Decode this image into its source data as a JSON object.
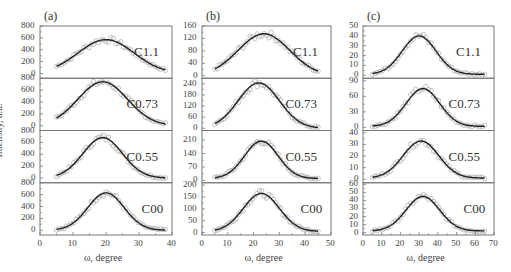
{
  "figure": {
    "ylabel": "Intensity, a.u.",
    "panels": [
      {
        "label": "(a)",
        "xlabel": "ω, degree",
        "xticks": [
          "0",
          "10",
          "20",
          "30",
          "40"
        ],
        "xlim": [
          0,
          40
        ],
        "subplots": [
          {
            "name": "C1.1",
            "yticks": [
              "0",
              "200",
              "400",
              "600",
              "800"
            ],
            "ylim": [
              -80,
              800
            ]
          },
          {
            "name": "C0.73",
            "yticks": [
              "0",
              "200",
              "400",
              "600",
              "800"
            ],
            "ylim": [
              -80,
              800
            ]
          },
          {
            "name": "C0.55",
            "yticks": [
              "0",
              "200",
              "400",
              "600",
              "800"
            ],
            "ylim": [
              -80,
              800
            ]
          },
          {
            "name": "C00",
            "yticks": [
              "0",
              "200",
              "400",
              "600",
              "800"
            ],
            "ylim": [
              -80,
              800
            ]
          }
        ]
      },
      {
        "label": "(b)",
        "xlabel": "ω, degree",
        "xticks": [
          "0",
          "10",
          "20",
          "30",
          "40",
          "50"
        ],
        "xlim": [
          0,
          50
        ],
        "subplots": [
          {
            "name": "C1.1",
            "yticks": [
              "0",
              "40",
              "80",
              "120",
              "160"
            ],
            "ylim": [
              -8,
              160
            ]
          },
          {
            "name": "C0.73",
            "yticks": [
              "0",
              "60",
              "120",
              "180",
              "240"
            ],
            "ylim": [
              -12,
              270
            ]
          },
          {
            "name": "C0.55",
            "yticks": [
              "0",
              "70",
              "140",
              "210"
            ],
            "ylim": [
              -12,
              260
            ]
          },
          {
            "name": "C00",
            "yticks": [
              "0",
              "50",
              "100",
              "150",
              "200"
            ],
            "ylim": [
              -10,
              210
            ]
          }
        ]
      },
      {
        "label": "(c)",
        "xlabel": "ω, degree",
        "xticks": [
          "0",
          "10",
          "20",
          "30",
          "40",
          "50",
          "60",
          "70"
        ],
        "xlim": [
          0,
          70
        ],
        "subplots": [
          {
            "name": "C1.1",
            "yticks": [
              "0",
              "10",
              "20",
              "30",
              "40",
              "50"
            ],
            "ylim": [
              -3,
              50
            ]
          },
          {
            "name": "C0.73",
            "yticks": [
              "0",
              "30",
              "60",
              "90"
            ],
            "ylim": [
              -6,
              95
            ]
          },
          {
            "name": "C0.55",
            "yticks": [
              "0",
              "10",
              "20",
              "30",
              "40"
            ],
            "ylim": [
              -3,
              42
            ]
          },
          {
            "name": "C00",
            "yticks": [
              "0",
              "10",
              "20",
              "30",
              "40",
              "50",
              "60"
            ],
            "ylim": [
              -3,
              62
            ]
          }
        ]
      }
    ]
  },
  "chart_data": [
    {
      "type": "scatter",
      "title": "(a)",
      "xlabel": "ω, degree",
      "ylabel": "Intensity, a.u.",
      "x_range": [
        5,
        38
      ],
      "series": [
        {
          "name": "C1.1",
          "peak_x": 20,
          "peak_y": 570,
          "width_sigma": 8.5,
          "baseline": 0,
          "start_y": 60,
          "end_y": 20
        },
        {
          "name": "C0.73",
          "peak_x": 19,
          "peak_y": 740,
          "width_sigma": 7.5,
          "baseline": 0,
          "start_y": 60,
          "end_y": 20
        },
        {
          "name": "C0.55",
          "peak_x": 19,
          "peak_y": 680,
          "width_sigma": 6.0,
          "baseline": 0,
          "start_y": 60,
          "end_y": 30
        },
        {
          "name": "C00",
          "peak_x": 20,
          "peak_y": 630,
          "width_sigma": 5.5,
          "baseline": 0,
          "start_y": 60,
          "end_y": 40
        }
      ]
    },
    {
      "type": "scatter",
      "title": "(b)",
      "xlabel": "ω, degree",
      "ylabel": "Intensity, a.u.",
      "x_range": [
        5,
        45
      ],
      "series": [
        {
          "name": "C1.1",
          "peak_x": 24,
          "peak_y": 135,
          "width_sigma": 10,
          "baseline": 0,
          "start_y": 15,
          "end_y": 5
        },
        {
          "name": "C0.73",
          "peak_x": 22,
          "peak_y": 245,
          "width_sigma": 8,
          "baseline": 0,
          "start_y": 30,
          "end_y": 10
        },
        {
          "name": "C0.55",
          "peak_x": 23,
          "peak_y": 205,
          "width_sigma": 6.5,
          "baseline": 10,
          "start_y": 20,
          "end_y": 10
        },
        {
          "name": "C00",
          "peak_x": 23,
          "peak_y": 165,
          "width_sigma": 7,
          "baseline": 5,
          "start_y": 20,
          "end_y": 10
        }
      ]
    },
    {
      "type": "scatter",
      "title": "(c)",
      "xlabel": "ω, degree",
      "ylabel": "Intensity, a.u.",
      "x_range": [
        5,
        65
      ],
      "series": [
        {
          "name": "C1.1",
          "peak_x": 30,
          "peak_y": 40,
          "width_sigma": 9,
          "baseline": 1,
          "start_y": 3,
          "end_y": 1
        },
        {
          "name": "C0.73",
          "peak_x": 32,
          "peak_y": 75,
          "width_sigma": 9,
          "baseline": 2,
          "start_y": 5,
          "end_y": 3
        },
        {
          "name": "C0.55",
          "peak_x": 31,
          "peak_y": 33,
          "width_sigma": 9.5,
          "baseline": 1,
          "start_y": 2,
          "end_y": 1
        },
        {
          "name": "C00",
          "peak_x": 32,
          "peak_y": 45,
          "width_sigma": 9,
          "baseline": 2,
          "start_y": 4,
          "end_y": 2
        }
      ]
    }
  ]
}
